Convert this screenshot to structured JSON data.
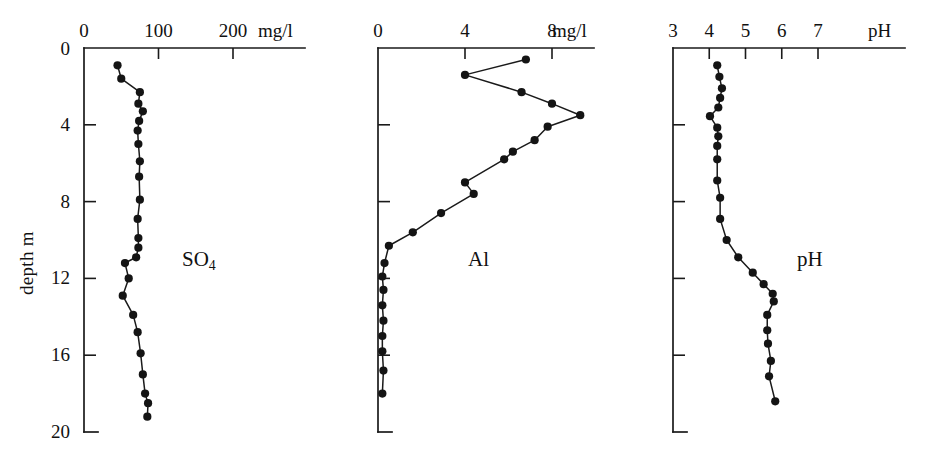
{
  "figure": {
    "depth_axis": {
      "title": "depth m",
      "min": 0,
      "max": 20,
      "ticks": [
        0,
        4,
        8,
        12,
        16,
        20
      ],
      "tick_labels": [
        "0",
        "4",
        "8",
        "12",
        "16",
        "20"
      ]
    }
  },
  "chart_data": [
    {
      "type": "line",
      "id": "so4",
      "title": "SO4",
      "series_label": "SO",
      "series_label_sub": "4",
      "xlabel": "mg/l",
      "ylabel": "depth m",
      "xlim": [
        0,
        250
      ],
      "ylim": [
        0,
        20
      ],
      "xticks": [
        0,
        100,
        200
      ],
      "xtick_labels": [
        "0",
        "100",
        "200"
      ],
      "yticks": [
        0,
        4,
        8,
        12,
        16,
        20
      ],
      "ytick_labels": [
        "0",
        "4",
        "8",
        "12",
        "16",
        "20"
      ],
      "grid": false,
      "orientation": "depth-vertical-inverted",
      "x": [
        45,
        50,
        75,
        73,
        79,
        74,
        72,
        73,
        75,
        74,
        75,
        72,
        73,
        73,
        70,
        55,
        60,
        52,
        66,
        72,
        76,
        79,
        82,
        86,
        85
      ],
      "y": [
        0.9,
        1.6,
        2.3,
        2.9,
        3.3,
        3.8,
        4.3,
        5.0,
        5.9,
        6.7,
        7.9,
        8.9,
        9.9,
        10.4,
        10.9,
        11.2,
        12.0,
        12.9,
        13.9,
        14.8,
        15.9,
        17.0,
        18.0,
        18.5,
        19.2
      ]
    },
    {
      "type": "line",
      "id": "al",
      "title": "Al",
      "series_label": "Al",
      "xlabel": "mg/l",
      "ylabel": "depth m",
      "xlim": [
        0,
        10.4
      ],
      "ylim": [
        0,
        20
      ],
      "xticks": [
        0,
        4,
        8
      ],
      "xtick_labels": [
        "0",
        "4",
        "8"
      ],
      "yticks": [
        0,
        4,
        8,
        12,
        16,
        20
      ],
      "ytick_labels": [
        "0",
        "4",
        "8",
        "12",
        "16",
        "20"
      ],
      "grid": false,
      "orientation": "depth-vertical-inverted",
      "x": [
        6.8,
        4.0,
        6.6,
        8.0,
        9.3,
        7.8,
        7.2,
        6.2,
        5.8,
        4.0,
        4.4,
        2.9,
        1.6,
        0.5,
        0.3,
        0.2,
        0.25,
        0.2,
        0.25,
        0.2,
        0.2,
        0.25,
        0.2
      ],
      "y": [
        0.6,
        1.4,
        2.3,
        2.9,
        3.5,
        4.1,
        4.8,
        5.4,
        5.8,
        7.0,
        7.6,
        8.6,
        9.6,
        10.3,
        11.2,
        11.9,
        12.6,
        13.4,
        14.2,
        15.0,
        15.8,
        16.8,
        18.0
      ]
    },
    {
      "type": "line",
      "id": "ph",
      "title": "pH",
      "series_label": "pH",
      "xlabel": "pH",
      "ylabel": "depth m",
      "xlim": [
        3,
        8
      ],
      "ylim": [
        0,
        20
      ],
      "xticks": [
        3,
        4,
        5,
        6,
        7
      ],
      "xtick_labels": [
        "3",
        "4",
        "5",
        "6",
        "7"
      ],
      "yticks": [
        0,
        4,
        8,
        12,
        16,
        20
      ],
      "ytick_labels": [
        "0",
        "4",
        "8",
        "12",
        "16",
        "20"
      ],
      "grid": false,
      "orientation": "depth-vertical-inverted",
      "x": [
        4.22,
        4.28,
        4.35,
        4.3,
        4.25,
        4.02,
        4.22,
        4.25,
        4.22,
        4.22,
        4.22,
        4.3,
        4.3,
        4.48,
        4.8,
        5.2,
        5.5,
        5.75,
        5.78,
        5.6,
        5.6,
        5.62,
        5.7,
        5.65,
        5.82
      ],
      "y": [
        0.9,
        1.5,
        2.1,
        2.6,
        3.1,
        3.55,
        4.15,
        4.6,
        5.1,
        5.8,
        6.9,
        7.8,
        8.9,
        10.0,
        10.9,
        11.7,
        12.3,
        12.8,
        13.2,
        13.9,
        14.7,
        15.4,
        16.3,
        17.1,
        18.4
      ]
    }
  ]
}
